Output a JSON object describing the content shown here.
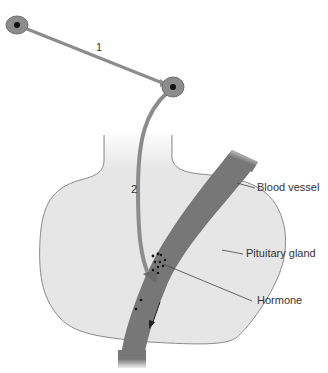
{
  "diagram": {
    "labels": {
      "neuron1": "1",
      "neuron2": "2",
      "blood_vessel": "Blood vessel",
      "pituitary_gland": "Pituitary gland",
      "hormone": "Hormone"
    },
    "colors": {
      "gland_fill": "#e6e6e6",
      "gland_stroke": "#8a8a8a",
      "vessel": "#7a7a7a",
      "neuron": "#8c8c8c",
      "nucleus": "#111111",
      "text": "#333333"
    }
  }
}
